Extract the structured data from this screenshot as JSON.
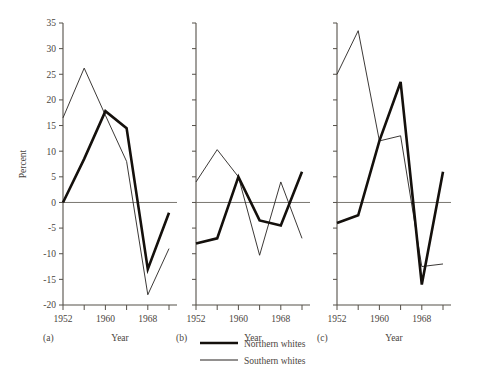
{
  "chart_data": {
    "type": "line",
    "title": "",
    "xlabel": "Year",
    "ylabel": "Percent",
    "ylim": [
      -20,
      35
    ],
    "yticks": [
      -20,
      -15,
      -10,
      -5,
      0,
      5,
      10,
      15,
      20,
      25,
      30,
      35
    ],
    "ytick_labels": [
      "-20",
      "-15",
      "-10",
      "-5",
      "0",
      "5",
      "10",
      "15",
      "20",
      "25",
      "30",
      "35"
    ],
    "xlim": [
      1952,
      1972
    ],
    "xticks": [
      1952,
      1956,
      1960,
      1964,
      1968,
      1972
    ],
    "xtick_labels": [
      "1952",
      "",
      "1960",
      "",
      "1968",
      ""
    ],
    "x": [
      1952,
      1956,
      1960,
      1964,
      1968,
      1972
    ],
    "grid": false,
    "legend_position": "bottom-center",
    "legend": [
      "Northern whites",
      "Southern whites"
    ],
    "panels": [
      {
        "label": "(a)",
        "xlabel": "Year",
        "show_yaxis_labels": true,
        "series": [
          {
            "name": "Northern whites",
            "values": [
              0,
              8.5,
              17.8,
              14.5,
              -13,
              -2
            ]
          },
          {
            "name": "Southern whites",
            "values": [
              16.5,
              26.2,
              17,
              8,
              -18,
              -9
            ]
          }
        ]
      },
      {
        "label": "(b)",
        "xlabel": "Year",
        "show_yaxis_labels": false,
        "series": [
          {
            "name": "Northern whites",
            "values": [
              -8,
              -7,
              5,
              -3.5,
              -4.5,
              6
            ]
          },
          {
            "name": "Southern whites",
            "values": [
              4,
              10.3,
              5,
              -10.3,
              4,
              -7
            ]
          }
        ]
      },
      {
        "label": "(c)",
        "xlabel": "Year",
        "show_yaxis_labels": false,
        "series": [
          {
            "name": "Northern whites",
            "values": [
              -4,
              -2.5,
              12,
              23.5,
              -16,
              6
            ]
          },
          {
            "name": "Southern whites",
            "values": [
              25,
              33.5,
              12,
              13,
              -12.5,
              -12
            ]
          }
        ]
      }
    ]
  },
  "axis": {
    "ylabel": "Percent",
    "xlabel": "Year"
  },
  "legend": {
    "items": [
      {
        "label": "Northern whites",
        "style": "thick"
      },
      {
        "label": "Southern whites",
        "style": "thin"
      }
    ]
  },
  "panel_labels": {
    "a": "(a)",
    "b": "(b)",
    "c": "(c)"
  },
  "colors": {
    "northern": "#14100c",
    "southern": "#262220",
    "axis": "#555049",
    "text": "#4a4540",
    "background": "#ffffff"
  }
}
